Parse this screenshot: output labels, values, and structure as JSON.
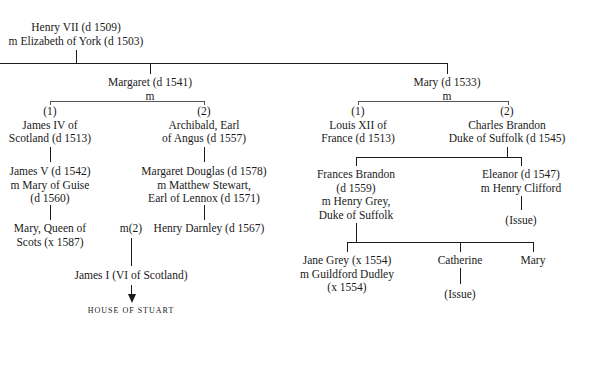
{
  "tree": {
    "root": {
      "line1": "Henry VII (d 1509)",
      "line2": "m  Elizabeth of York (d 1503)"
    },
    "margaret": {
      "name": "Margaret (d 1541)",
      "m": "m",
      "spouse1": {
        "ordinal": "(1)",
        "line1": "James IV of",
        "line2": "Scotland (d 1513)"
      },
      "spouse2": {
        "ordinal": "(2)",
        "line1": "Archibald, Earl",
        "line2": "of Angus (d 1557)"
      },
      "james5": {
        "line1": "James V (d 1542)",
        "line2": "m  Mary of Guise",
        "line3": "(d 1560)"
      },
      "margaret_douglas": {
        "line1": "Margaret Douglas (d 1578)",
        "line2": "m  Matthew Stewart,",
        "line3": "Earl of  Lennox (d 1571)"
      },
      "mary_qos": {
        "line1": "Mary, Queen of",
        "line2": "Scots (x 1587)"
      },
      "m2": "m(2)",
      "darnley": "Henry Darnley (d 1567)",
      "james1": "James I (VI of Scotland)",
      "house": "HOUSE OF STUART"
    },
    "mary": {
      "name": "Mary (d 1533)",
      "m": "m",
      "spouse1": {
        "ordinal": "(1)",
        "line1": "Louis XII of",
        "line2": "France (d 1513)"
      },
      "spouse2": {
        "ordinal": "(2)",
        "line1": "Charles Brandon",
        "line2": "Duke of Suffolk  (d 1545)"
      },
      "frances": {
        "line1": "Frances Brandon",
        "line2": "(d 1559)",
        "line3": "m  Henry Grey,",
        "line4": "Duke of Suffolk"
      },
      "eleanor": {
        "line1": "Eleanor (d 1547)",
        "line2": "m  Henry Clifford",
        "issue": "(Issue)"
      },
      "jane": {
        "line1": "Jane Grey (x 1554)",
        "line2": "m  Guildford Dudley",
        "line3": "(x 1554)"
      },
      "catherine": {
        "name": "Catherine",
        "issue": "(Issue)"
      },
      "mary_grey": "Mary"
    }
  }
}
